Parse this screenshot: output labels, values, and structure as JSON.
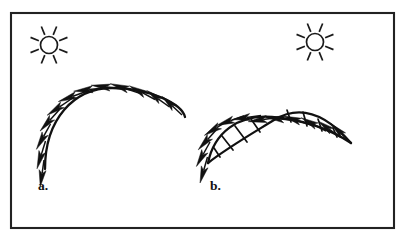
{
  "figure": {
    "background_color": "#ffffff",
    "ink_color": "#111111",
    "frame": {
      "name": "outer-border",
      "x": 11,
      "y": 13,
      "width": 383,
      "height": 215,
      "stroke_color": "#222222",
      "stroke_width": 2.1
    },
    "panels": [
      {
        "id": "a",
        "label": "a.",
        "label_x": 38,
        "label_y": 190,
        "description": "single smooth convex arc with outward normal arrows",
        "sun": {
          "name": "sun-icon",
          "cx": 49,
          "cy": 45,
          "radius": 8.5,
          "ray_count": 8,
          "ray_inner": 11,
          "ray_outer": 20
        },
        "curve": {
          "name": "convex-arc",
          "type": "single",
          "path": "M 45 169 C 45 119, 74 88, 112 88 C 150 88, 182 104, 185 117"
        },
        "arrows": [
          {
            "x": 44.0,
            "y": 160.0,
            "angle": 188,
            "length": 27
          },
          {
            "x": 45.5,
            "y": 141.0,
            "angle": 197,
            "length": 29
          },
          {
            "x": 50.5,
            "y": 124.0,
            "angle": 209,
            "length": 29
          },
          {
            "x": 59.5,
            "y": 109.5,
            "angle": 222,
            "length": 29
          },
          {
            "x": 72.0,
            "y": 98.5,
            "angle": 236,
            "length": 30
          },
          {
            "x": 87.5,
            "y": 91.0,
            "angle": 250,
            "length": 31
          },
          {
            "x": 104.5,
            "y": 88.0,
            "angle": 264,
            "length": 31
          },
          {
            "x": 122.0,
            "y": 89.0,
            "angle": 277,
            "length": 31
          },
          {
            "x": 139.0,
            "y": 93.0,
            "angle": 288,
            "length": 30
          },
          {
            "x": 155.0,
            "y": 99.5,
            "angle": 298,
            "length": 29
          },
          {
            "x": 169.5,
            "y": 107.0,
            "angle": 306,
            "length": 28
          },
          {
            "x": 182.0,
            "y": 115.0,
            "angle": 313,
            "length": 27
          }
        ]
      },
      {
        "id": "b",
        "label": "b.",
        "label_x": 210,
        "label_y": 190,
        "description": "two intersecting ribbon lobes (crossing arcs) with outward normal arrows",
        "sun": {
          "name": "sun-icon",
          "cx": 315,
          "cy": 42,
          "radius": 8.5,
          "ray_count": 8,
          "ray_inner": 11,
          "ray_outer": 20
        },
        "curves": [
          {
            "name": "outer-arc-upper",
            "path": "M 208 163 C 214 133, 238 114, 272 117 C 306 120, 333 131, 351 143"
          },
          {
            "name": "inner-arc-lower",
            "path": "M 208 163 C 224 150, 248 136, 274 120 C 300 104, 326 114, 351 143"
          }
        ],
        "rungs": [
          {
            "x1": 214.0,
            "y1": 148.0,
            "x2": 220.0,
            "y2": 157.0
          },
          {
            "x1": 222.0,
            "y1": 136.0,
            "x2": 233.0,
            "y2": 150.0
          },
          {
            "x1": 235.0,
            "y1": 126.0,
            "x2": 247.0,
            "y2": 142.0
          },
          {
            "x1": 251.0,
            "y1": 119.0,
            "x2": 260.0,
            "y2": 132.0
          },
          {
            "x1": 287.0,
            "y1": 110.0,
            "x2": 291.0,
            "y2": 122.0
          },
          {
            "x1": 303.0,
            "y1": 112.0,
            "x2": 307.0,
            "y2": 126.0
          },
          {
            "x1": 318.0,
            "y1": 119.0,
            "x2": 322.0,
            "y2": 131.0
          },
          {
            "x1": 333.0,
            "y1": 128.0,
            "x2": 337.0,
            "y2": 137.0
          }
        ],
        "arrows": [
          {
            "x": 207.5,
            "y": 157.0,
            "angle": 196,
            "length": 27
          },
          {
            "x": 210.0,
            "y": 142.0,
            "angle": 209,
            "length": 28
          },
          {
            "x": 217.0,
            "y": 129.0,
            "angle": 222,
            "length": 28
          },
          {
            "x": 229.0,
            "y": 120.0,
            "angle": 238,
            "length": 29
          },
          {
            "x": 244.0,
            "y": 116.0,
            "angle": 251,
            "length": 29
          },
          {
            "x": 261.0,
            "y": 115.5,
            "angle": 262,
            "length": 29
          },
          {
            "x": 278.0,
            "y": 117.5,
            "angle": 262,
            "length": 30
          },
          {
            "x": 295.0,
            "y": 120.5,
            "angle": 276,
            "length": 29
          },
          {
            "x": 311.0,
            "y": 125.0,
            "angle": 288,
            "length": 29
          },
          {
            "x": 326.0,
            "y": 131.0,
            "angle": 298,
            "length": 28
          },
          {
            "x": 340.0,
            "y": 137.0,
            "angle": 306,
            "length": 27
          },
          {
            "x": 350.5,
            "y": 142.5,
            "angle": 314,
            "length": 27
          }
        ]
      }
    ]
  }
}
